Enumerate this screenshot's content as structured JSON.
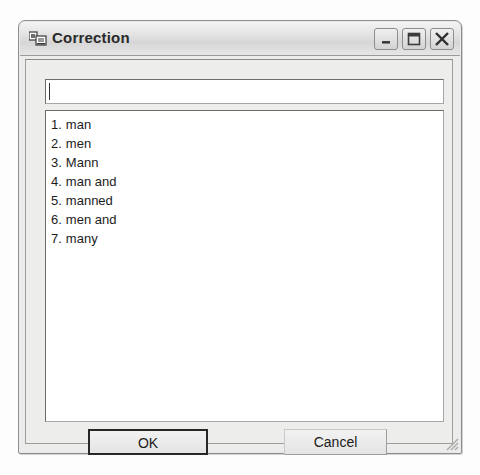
{
  "window": {
    "title": "Correction",
    "icon": "computer-window-icon",
    "controls": {
      "minimize_label": "Minimize",
      "maximize_label": "Maximize",
      "close_label": "Close"
    }
  },
  "input": {
    "value": "",
    "placeholder": ""
  },
  "suggestions": {
    "items": [
      {
        "number": "1.",
        "word": "man"
      },
      {
        "number": "2.",
        "word": "men"
      },
      {
        "number": "3.",
        "word": "Mann"
      },
      {
        "number": "4.",
        "word": "man and"
      },
      {
        "number": "5.",
        "word": "manned"
      },
      {
        "number": "6.",
        "word": "men and"
      },
      {
        "number": "7.",
        "word": "many"
      }
    ]
  },
  "buttons": {
    "ok_label": "OK",
    "cancel_label": "Cancel"
  },
  "colors": {
    "window_background": "#e9e9e9",
    "titlebar": "#dcdcdc",
    "field_background": "#ffffff",
    "border": "#6d6d6d",
    "text": "#1c1c1c"
  }
}
